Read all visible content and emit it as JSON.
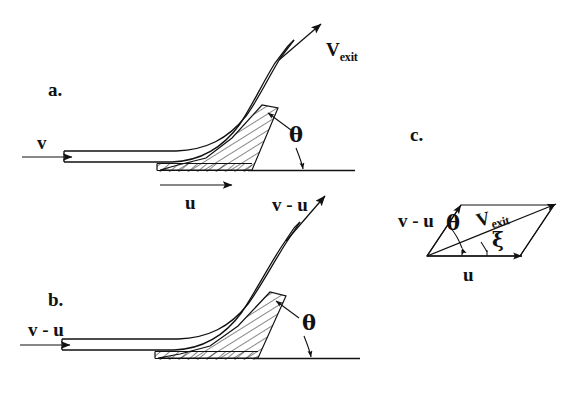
{
  "figure": {
    "background_color": "#ffffff",
    "ink_color": "#111111",
    "width": 570,
    "height": 396
  },
  "panels": [
    {
      "id": "a",
      "letter": "a.",
      "description": "Curved blade in stationary (absolute) frame: jet enters at speed v, blade moves at speed u, jet leaves at V_exit",
      "labels": {
        "inlet": "v",
        "blade_speed": "u",
        "exit": "V",
        "exit_subscript": "exit",
        "angle": "θ"
      }
    },
    {
      "id": "b",
      "letter": "b.",
      "description": "Same blade in the moving (relative) frame: jet enters and leaves at relative speed v - u",
      "labels": {
        "inlet": "v - u",
        "exit": "v - u",
        "angle": "θ"
      }
    },
    {
      "id": "c",
      "letter": "c.",
      "description": "Velocity parallelogram combining blade speed u with relative exit velocity v - u to give absolute exit velocity V_exit",
      "labels": {
        "relative": "v - u",
        "blade_speed": "u",
        "exit": "V",
        "exit_subscript": "exit",
        "angle_theta": "θ",
        "angle_xi": "ξ"
      }
    }
  ],
  "symbols": {
    "theta": "θ",
    "xi": "ξ",
    "v": "v",
    "u": "u",
    "v_minus_u": "v - u",
    "v_exit_base": "V",
    "v_exit_sub": "exit"
  }
}
